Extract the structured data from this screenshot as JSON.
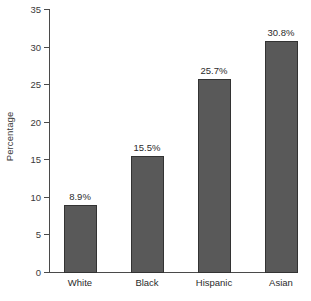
{
  "chart_data": {
    "type": "bar",
    "title": "",
    "subtitle": "",
    "xlabel": "",
    "ylabel": "Percentage",
    "categories": [
      "White",
      "Black",
      "Hispanic",
      "Asian"
    ],
    "values": [
      8.9,
      15.5,
      25.7,
      30.8
    ],
    "data_labels": [
      "8.9%",
      "15.5%",
      "25.7%",
      "30.8%"
    ],
    "ylim": [
      0,
      35
    ],
    "yticks": [
      0,
      5,
      10,
      15,
      20,
      25,
      30,
      35
    ],
    "ytick_labels": [
      "0",
      "5",
      "10",
      "15",
      "20",
      "25",
      "30",
      "35"
    ],
    "grid": false,
    "legend": null,
    "legend_position": "none",
    "series": [
      {
        "name": "Percentage",
        "values": [
          8.9,
          15.5,
          25.7,
          30.8
        ]
      }
    ],
    "colors": {
      "bar_fill": "#595959",
      "bar_border": "#333333",
      "axis": "#4a4a4a",
      "text": "#2b2b2b",
      "background": "#ffffff"
    }
  }
}
